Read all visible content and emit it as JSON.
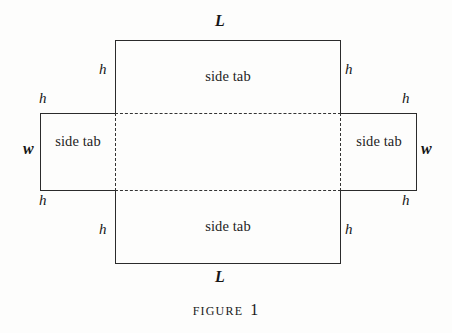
{
  "figure": {
    "caption_word": "Figure",
    "caption_number": "1",
    "panels": {
      "top": "side tab",
      "bottom": "side tab",
      "left": "side tab",
      "right": "side tab"
    },
    "dimensions": {
      "length_top": "L",
      "length_bottom": "L",
      "width_left": "w",
      "width_right": "w",
      "height_top_left_inner": "h",
      "height_top_right_inner": "h",
      "height_middle_left_outer": "h",
      "height_middle_right_outer": "h",
      "height_bottom_left_outer": "h",
      "height_bottom_right_outer": "h",
      "height_bottom_left_inner": "h",
      "height_bottom_right_inner": "h"
    },
    "colors": {
      "ink": "#2b2b2b",
      "fold_line": "#333333",
      "paper": "#fdfdfc"
    }
  }
}
